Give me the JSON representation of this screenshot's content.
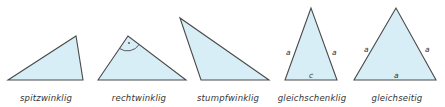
{
  "colors": {
    "fill": "#d8eef6",
    "stroke": "#4a4a4a",
    "text": "#333333",
    "background": "#ffffff"
  },
  "triangles": [
    {
      "name": "spitzwinklig",
      "caption": "spitzwinklig",
      "points": [
        [
          8,
          80
        ],
        [
          76,
          36
        ],
        [
          83,
          80
        ]
      ],
      "side_labels": []
    },
    {
      "name": "rechtwinklig",
      "caption": "rechtwinklig",
      "points": [
        [
          98,
          80
        ],
        [
          128,
          36
        ],
        [
          186,
          80
        ]
      ],
      "right_angle_mark": {
        "vertex": [
          128,
          36
        ],
        "dot": "·"
      },
      "side_labels": []
    },
    {
      "name": "stumpfwinklig",
      "caption": "stumpfwinklig",
      "points": [
        [
          180,
          18
        ],
        [
          201,
          80
        ],
        [
          269,
          80
        ]
      ],
      "side_labels": []
    },
    {
      "name": "gleichschenklig",
      "caption": "gleichschenklig",
      "points": [
        [
          311,
          8
        ],
        [
          285,
          80
        ],
        [
          337,
          80
        ]
      ],
      "side_labels": [
        {
          "text": "a",
          "x": 287,
          "y": 55
        },
        {
          "text": "a",
          "x": 334,
          "y": 55
        },
        {
          "text": "c",
          "x": 309,
          "y": 78
        }
      ]
    },
    {
      "name": "gleichseitig",
      "caption": "gleichseitig",
      "points": [
        [
          396,
          8
        ],
        [
          354,
          80
        ],
        [
          436,
          80
        ]
      ],
      "side_labels": [
        {
          "text": "a",
          "x": 362,
          "y": 52
        },
        {
          "text": "a",
          "x": 427,
          "y": 52
        },
        {
          "text": "a",
          "x": 396,
          "y": 78
        }
      ]
    }
  ],
  "captions": {
    "t1": "spitzwinklig",
    "t2": "rechtwinklig",
    "t3": "stumpfwinklig",
    "t4": "gleichschenklig",
    "t5": "gleichseitig"
  },
  "labels": {
    "t4_left": "a",
    "t4_right": "a",
    "t4_base": "c",
    "t5_left": "a",
    "t5_right": "a",
    "t5_base": "a",
    "right_angle_dot": "·"
  }
}
